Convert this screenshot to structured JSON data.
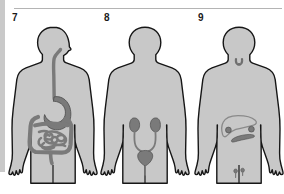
{
  "plate": {
    "width": 284,
    "height": 194,
    "background_color": "#ffffff",
    "gutter_color": "#c9c9c9",
    "rule_color": "#b4b4b4"
  },
  "style": {
    "body_fill": "#c8c8c8",
    "body_outline": "#161616",
    "organ_fill": "#7a7a7a",
    "organ_outline": "#4a4a4a",
    "organ_light_fill": "#9a9a9a",
    "label_color": "#1a1a1a"
  },
  "figures": [
    {
      "number": "7",
      "system": "digestive-system",
      "organs": [
        "esophagus",
        "stomach",
        "small-intestine",
        "large-intestine",
        "rectum"
      ]
    },
    {
      "number": "8",
      "system": "urinary-system",
      "organs": [
        "left-kidney",
        "right-kidney",
        "left-ureter",
        "right-ureter",
        "bladder",
        "urethra"
      ]
    },
    {
      "number": "9",
      "system": "endocrine-glandular-system",
      "organs": [
        "thyroid-gland",
        "liver",
        "adrenal-glands",
        "pancreas",
        "gonads"
      ]
    }
  ]
}
